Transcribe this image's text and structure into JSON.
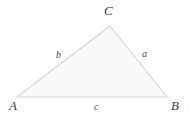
{
  "diagram": {
    "type": "triangle-diagram",
    "background_color": "#ffffff",
    "fill_color": "#fafafa",
    "stroke_color": "#d5d5d5",
    "label_color": "#3d3d3d",
    "vertices": [
      {
        "name": "A",
        "label": "A",
        "x": 17,
        "y": 97
      },
      {
        "name": "B",
        "label": "B",
        "x": 167,
        "y": 97
      },
      {
        "name": "C",
        "label": "C",
        "x": 110,
        "y": 26
      }
    ],
    "sides": [
      {
        "name": "a",
        "label": "a",
        "between": "B-C"
      },
      {
        "name": "b",
        "label": "b",
        "between": "A-C"
      },
      {
        "name": "c",
        "label": "c",
        "between": "A-B"
      }
    ],
    "polygon_points": "17,97 110,26 167,97"
  }
}
